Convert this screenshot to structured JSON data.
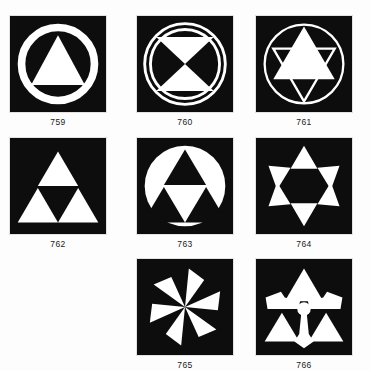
{
  "page": {
    "background_color": "#fdfdfd",
    "panel_background": "#0d0d0d",
    "figure_color": "#ffffff",
    "title": ""
  },
  "figures": [
    {
      "number": "759",
      "name": "triangle-in-ring",
      "row": 1,
      "column": 1,
      "elements": [
        "thick white circle ring",
        "solid white upward triangle"
      ]
    },
    {
      "number": "760",
      "name": "hourglass-in-double-ring",
      "row": 1,
      "column": 2,
      "elements": [
        "outer thin white ring",
        "inner thin white ring",
        "white upward triangle",
        "white downward triangle meeting at center"
      ]
    },
    {
      "number": "761",
      "name": "hexagram-in-thin-ring",
      "row": 1,
      "column": 3,
      "elements": [
        "thin white circle ring",
        "outlined white downward triangle",
        "solid white upward triangle"
      ]
    },
    {
      "number": "762",
      "name": "triforce-three-triangles",
      "row": 2,
      "column": 1,
      "elements": [
        "three solid white upward triangles in triangular arrangement"
      ]
    },
    {
      "number": "763",
      "name": "triforce-inverted-on-white-disc",
      "row": 2,
      "column": 2,
      "elements": [
        "solid white circle disc",
        "three solid black upward triangles forming a triforce"
      ]
    },
    {
      "number": "764",
      "name": "six-pointed-star-points",
      "row": 2,
      "column": 3,
      "elements": [
        "six white star points",
        "black hexagonal center"
      ]
    },
    {
      "number": "765",
      "name": "six-blade-pinwheel",
      "row": 3,
      "column": 2,
      "elements": [
        "six white curved pinwheel blades radiating from a center point"
      ]
    },
    {
      "number": "766",
      "name": "winged-triad-emblem",
      "row": 3,
      "column": 3,
      "elements": [
        "central white disc",
        "upper white triangle",
        "two white wing shapes",
        "two lower white triangles",
        "white pendant drop at bottom"
      ]
    }
  ]
}
